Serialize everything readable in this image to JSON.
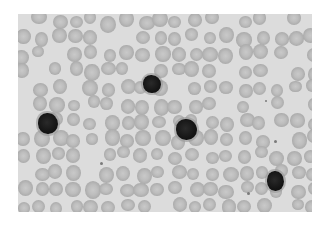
{
  "image": {
    "subject": "blood smear micrograph",
    "description": "Red blood cells with several dark-staining lymphocytes",
    "colors": {
      "background": "#dcdcdc",
      "red_blood_cell": "#b5b5b5",
      "white_blood_cell": "#151515",
      "border": "#ffffff"
    },
    "white_blood_cells": [
      {
        "x": 143,
        "y": 75,
        "w": 18,
        "h": 18
      },
      {
        "x": 38,
        "y": 113,
        "w": 20,
        "h": 21
      },
      {
        "x": 176,
        "y": 119,
        "w": 21,
        "h": 21
      },
      {
        "x": 267,
        "y": 171,
        "w": 17,
        "h": 20
      }
    ],
    "platelets": [
      {
        "x": 100,
        "y": 162,
        "s": 3
      },
      {
        "x": 274,
        "y": 140,
        "s": 3
      },
      {
        "x": 247,
        "y": 192,
        "s": 3
      },
      {
        "x": 265,
        "y": 100,
        "s": 2
      }
    ]
  }
}
